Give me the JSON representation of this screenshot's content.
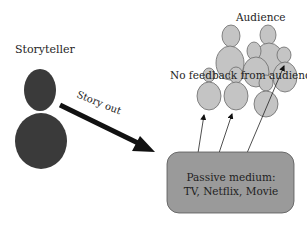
{
  "diagram": {
    "storyteller_label": "Storyteller",
    "arrow_label": "Story out",
    "audience_label": "Audience",
    "feedback_label": "No feedback from audience",
    "medium": {
      "line1": "Passive medium:",
      "line2": "TV, Netflix, Movie"
    }
  },
  "colors": {
    "storyteller_fill": "#3a3a3a",
    "audience_fill": "#c4c4c4",
    "audience_stroke": "#6a6a6a",
    "medium_fill": "#9a9a9a",
    "medium_stroke": "#555555",
    "arrow": "#111111"
  }
}
